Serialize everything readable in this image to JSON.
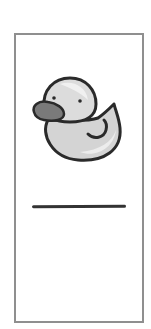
{
  "card": {
    "border_color": "#8f8f8f",
    "illustration": "rubber-duck",
    "line_color": "#333333"
  }
}
